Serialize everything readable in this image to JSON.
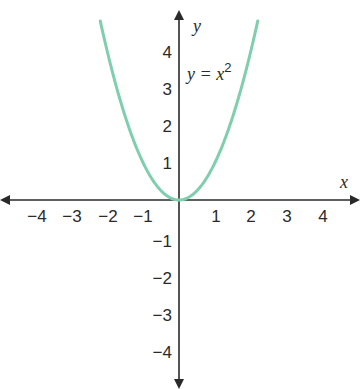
{
  "chart_data": {
    "type": "line",
    "title": "",
    "xlabel": "x",
    "ylabel": "y",
    "xlim": [
      -5,
      5
    ],
    "ylim": [
      -5,
      5
    ],
    "grid": false,
    "x_ticks": [
      -4,
      -3,
      -2,
      -1,
      1,
      2,
      3,
      4
    ],
    "y_ticks": [
      4,
      3,
      2,
      1,
      -1,
      -2,
      -3,
      -4
    ],
    "x_tick_labels": [
      "−4",
      "−3",
      "−2",
      "−1",
      "1",
      "2",
      "3",
      "4"
    ],
    "y_tick_labels": [
      "4",
      "3",
      "2",
      "1",
      "−1",
      "−2",
      "−3",
      "−4"
    ],
    "series": [
      {
        "name": "y = x^2",
        "function": "x^2",
        "color": "#7fcfae",
        "x": [
          -2.2,
          -2,
          -1.5,
          -1,
          -0.5,
          0,
          0.5,
          1,
          1.5,
          2,
          2.2
        ],
        "y": [
          4.84,
          4,
          2.25,
          1,
          0.25,
          0,
          0.25,
          1,
          2.25,
          4,
          4.84
        ]
      }
    ],
    "annotations": [
      {
        "text_base": "y = x",
        "text_sup": "2",
        "x": 0.3,
        "y": 3.2
      }
    ]
  },
  "colors": {
    "axis": "#2a2a2a",
    "curve": "#7fcfae",
    "background": "#ffffff"
  }
}
